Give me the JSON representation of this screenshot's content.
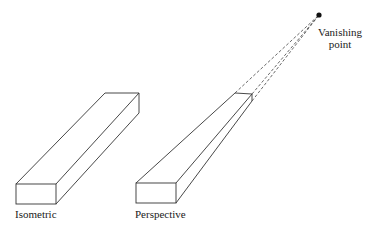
{
  "diagram": {
    "type": "projection-comparison",
    "stroke_color": "#333333",
    "background": "#ffffff",
    "figures": [
      {
        "id": "isometric",
        "label": "Isometric"
      },
      {
        "id": "perspective",
        "label": "Perspective"
      }
    ],
    "vanishing_point": {
      "label_line1": "Vanishing",
      "label_line2": "point"
    }
  }
}
